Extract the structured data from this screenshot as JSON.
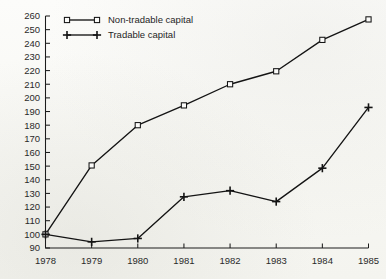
{
  "chart_data": {
    "type": "line",
    "title": "",
    "subtitle": "",
    "xlabel": "",
    "ylabel": "",
    "x": [
      1978,
      1979,
      1980,
      1981,
      1982,
      1983,
      1984,
      1985
    ],
    "categories": [
      "1978",
      "1979",
      "1980",
      "1981",
      "1982",
      "1983",
      "1984",
      "1985"
    ],
    "xlim": [
      1978,
      1985
    ],
    "ylim": [
      90,
      260
    ],
    "ytick_labels": [
      "90",
      "100",
      "110",
      "120",
      "130",
      "140",
      "150",
      "160",
      "170",
      "180",
      "190",
      "200",
      "210",
      "220",
      "230",
      "240",
      "250",
      "260"
    ],
    "ytick_values": [
      90,
      100,
      110,
      120,
      130,
      140,
      150,
      160,
      170,
      180,
      190,
      200,
      210,
      220,
      230,
      240,
      250,
      260
    ],
    "xtick_labels": [
      "1978",
      "1979",
      "1980",
      "1981",
      "1982",
      "1983",
      "1984",
      "1985"
    ],
    "grid": false,
    "legend_position": "top-left",
    "series": [
      {
        "name": "Non-tradable capital",
        "marker": "open-square",
        "values": [
          100,
          150.5,
          180,
          194.5,
          210,
          219.5,
          242.5,
          257.5
        ]
      },
      {
        "name": "Tradable capital",
        "marker": "plus",
        "values": [
          100,
          94.5,
          97,
          127.5,
          132,
          124,
          148.5,
          193
        ]
      }
    ]
  },
  "legend": {
    "items": [
      {
        "label": "Non-tradable capital",
        "marker": "open-square-marker"
      },
      {
        "label": "Tradable capital",
        "marker": "plus-marker"
      }
    ]
  },
  "colors": {
    "ink": "#141414",
    "paper": "#fbfbf9",
    "axis": "#1c1c1c"
  }
}
